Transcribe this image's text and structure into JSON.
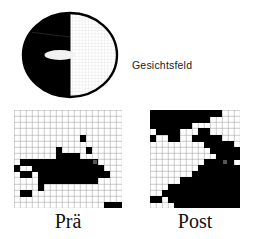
{
  "figure": {
    "name": "visual-field-perimetry-comparison",
    "background_color": "#ffffff",
    "ink_color": "#000000"
  },
  "diagram": {
    "label": "Gesichtsfeld",
    "blind_half": "left",
    "seeing_half": "right",
    "fovea_marker": "white-oval",
    "colors": {
      "blind": "#000000",
      "seeing": "#ffffff",
      "outline": "#000000",
      "grid": "#c9c9c9"
    }
  },
  "panels": [
    {
      "id": "pre",
      "caption": "Prä",
      "columns": 18,
      "rows": 16,
      "cell_colors": {
        "blind": "#000000",
        "seeing": "#ffffff",
        "grid": "#9a9a9a",
        "marker": "#555555"
      },
      "fixation_marker": {
        "col": 13,
        "row": 8
      },
      "grid": [
        "000000000000000000",
        "000000000000000000",
        "000000000000000000",
        "000000000000000000",
        "000000000001000000",
        "000000000000000000",
        "000000010000100000",
        "000000011110000000",
        "011111111111110000",
        "100111111111111000",
        "011011111111111100",
        "000011111111110000",
        "000010000000000000",
        "011000000000000000",
        "000000000000000000",
        "000000000000000111"
      ],
      "white_right_band": {
        "from_col": 13,
        "description": "seeing hemifield to the right of the vertical midline, rendered white with grid"
      }
    },
    {
      "id": "post",
      "caption": "Post",
      "columns": 15,
      "rows": 16,
      "cell_colors": {
        "blind": "#000000",
        "seeing": "#ffffff",
        "grid": "#9a9a9a",
        "marker": "#555555"
      },
      "fixation_marker": {
        "col": 12,
        "row": 8
      },
      "grid": [
        "111111111111000",
        "111111111100000",
        "111111100000000",
        "011110001100000",
        "100110011111000",
        "000000000111110",
        "000000000011111",
        "000000000001111",
        "000000000111110",
        "000000001111111",
        "000000011111111",
        "000001111111111",
        "000111111111111",
        "001111111111111",
        "110111111111111",
        "000011111111111"
      ]
    }
  ],
  "captions": {
    "pre": "Prä",
    "post": "Post"
  }
}
